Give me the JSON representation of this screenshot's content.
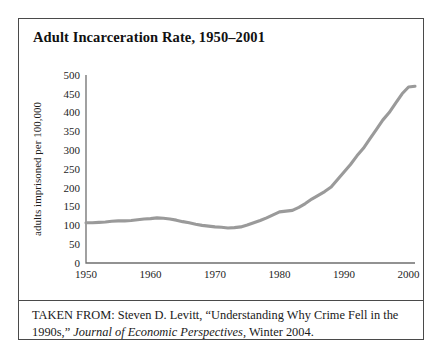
{
  "figure": {
    "title": "Adult Incarceration Rate, 1950–2001",
    "caption_prefix": "TAKEN FROM: Steven D. Levitt, “Understanding Why Crime Fell in the 1990s,” ",
    "caption_source": "Journal of Economic Perspectives",
    "caption_suffix": ", Winter 2004.",
    "border_color": "#4a4a4a",
    "background_color": "#ffffff"
  },
  "chart_data": {
    "type": "line",
    "title": "Adult Incarceration Rate, 1950–2001",
    "xlabel": "",
    "ylabel": "adults imprisoned per 100,000",
    "xlim": [
      1950,
      2001
    ],
    "ylim": [
      0,
      500
    ],
    "grid": false,
    "legend": null,
    "line_color": "#9a9a9a",
    "x_ticks": [
      1950,
      1960,
      1970,
      1980,
      1990,
      2000
    ],
    "x_tick_labels": [
      "1950",
      "1960",
      "1970",
      "1980",
      "1990",
      "2000"
    ],
    "y_ticks": [
      0,
      50,
      100,
      150,
      200,
      250,
      300,
      350,
      400,
      450,
      500
    ],
    "y_tick_labels": [
      "0",
      "50",
      "100",
      "150",
      "200",
      "250",
      "300",
      "350",
      "400",
      "450",
      "500"
    ],
    "x": [
      1950,
      1951,
      1952,
      1953,
      1954,
      1955,
      1956,
      1957,
      1958,
      1959,
      1960,
      1961,
      1962,
      1963,
      1964,
      1965,
      1966,
      1967,
      1968,
      1969,
      1970,
      1971,
      1972,
      1973,
      1974,
      1975,
      1976,
      1977,
      1978,
      1979,
      1980,
      1981,
      1982,
      1983,
      1984,
      1985,
      1986,
      1987,
      1988,
      1989,
      1990,
      1991,
      1992,
      1993,
      1994,
      1995,
      1996,
      1997,
      1998,
      1999,
      2000,
      2001
    ],
    "values": [
      107,
      107,
      108,
      109,
      111,
      112,
      112,
      113,
      115,
      117,
      118,
      120,
      119,
      117,
      114,
      110,
      107,
      103,
      100,
      98,
      96,
      95,
      93,
      94,
      96,
      101,
      107,
      113,
      120,
      128,
      136,
      138,
      140,
      148,
      158,
      170,
      180,
      190,
      202,
      222,
      242,
      262,
      285,
      305,
      330,
      355,
      380,
      400,
      425,
      450,
      468,
      470
    ],
    "annotations": [
      {
        "label": "local peak",
        "x": 1961,
        "y": 120
      },
      {
        "label": "trough",
        "x": 1972,
        "y": 93
      },
      {
        "label": "shoulder",
        "x": 1981,
        "y": 138
      },
      {
        "label": "plateau end",
        "x": 2001,
        "y": 470
      }
    ]
  }
}
